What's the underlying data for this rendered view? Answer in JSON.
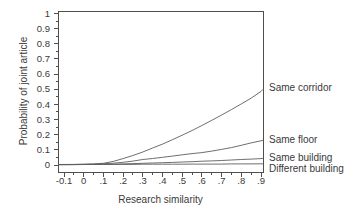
{
  "figure": {
    "background": "#ffffff",
    "ink_color": "#3a3a3a",
    "axis_color": "#4f4f4f",
    "curve_color": "#5e5e5e"
  },
  "chart_data": {
    "type": "line",
    "title": "",
    "xlabel": "Research similarity",
    "ylabel": "Probability of joint article",
    "xlim": [
      -0.13,
      0.91
    ],
    "ylim": [
      -0.046,
      1.013
    ],
    "grid": false,
    "legend_position": "labels-right-of-curve-ends",
    "x_tick_values": [
      -0.1,
      0,
      0.1,
      0.2,
      0.3,
      0.4,
      0.5,
      0.6,
      0.7,
      0.8,
      0.9
    ],
    "x_tick_labels": [
      "-0.1",
      "0",
      ".1",
      ".2",
      ".3",
      ".4",
      ".5",
      ".6",
      ".7",
      ".8",
      ".9"
    ],
    "y_tick_values": [
      0,
      0.1,
      0.2,
      0.3,
      0.4,
      0.5,
      0.6,
      0.7,
      0.8,
      0.9,
      1
    ],
    "y_tick_labels": [
      "0",
      "0.1",
      "0.2",
      "0.3",
      "0.4",
      "0.5",
      "0.6",
      "0.7",
      "0.8",
      "0.9",
      "1"
    ],
    "minor_tick_step": 0.05,
    "x": [
      -0.129,
      -0.05,
      0,
      0.05,
      0.1,
      0.15,
      0.2,
      0.25,
      0.3,
      0.35,
      0.4,
      0.45,
      0.5,
      0.55,
      0.6,
      0.65,
      0.7,
      0.75,
      0.8,
      0.85,
      0.9,
      0.91
    ],
    "series": [
      {
        "name": "Same corridor",
        "end_value": 0.5,
        "label_offset_y": 2,
        "values": [
          0.003,
          0.004,
          0.005,
          0.007,
          0.011,
          0.024,
          0.042,
          0.063,
          0.086,
          0.112,
          0.138,
          0.167,
          0.197,
          0.228,
          0.261,
          0.295,
          0.33,
          0.366,
          0.403,
          0.441,
          0.486,
          0.5
        ]
      },
      {
        "name": "Same floor",
        "end_value": 0.164,
        "label_offset_y": 3,
        "values": [
          0.002,
          0.003,
          0.004,
          0.005,
          0.008,
          0.012,
          0.018,
          0.026,
          0.036,
          0.043,
          0.051,
          0.059,
          0.067,
          0.075,
          0.082,
          0.092,
          0.103,
          0.115,
          0.13,
          0.146,
          0.16,
          0.164
        ]
      },
      {
        "name": "Same building",
        "end_value": 0.044,
        "label_offset_y": 3,
        "values": [
          0.002,
          0.002,
          0.003,
          0.003,
          0.004,
          0.005,
          0.007,
          0.009,
          0.011,
          0.013,
          0.015,
          0.017,
          0.02,
          0.022,
          0.025,
          0.027,
          0.03,
          0.033,
          0.036,
          0.039,
          0.042,
          0.044
        ]
      },
      {
        "name": "Different building",
        "end_value": 0.008,
        "label_offset_y": 8.5,
        "values": [
          0.003,
          0.003,
          0.003,
          0.003,
          0.004,
          0.004,
          0.004,
          0.004,
          0.005,
          0.005,
          0.005,
          0.005,
          0.005,
          0.006,
          0.006,
          0.006,
          0.006,
          0.007,
          0.007,
          0.007,
          0.008,
          0.008
        ]
      }
    ]
  }
}
